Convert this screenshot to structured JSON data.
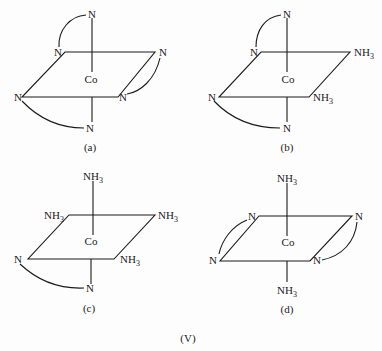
{
  "figure": {
    "label": "(V)",
    "central_atom": "Co",
    "panels": [
      {
        "id": "a",
        "caption": "(a)",
        "ligands": {
          "top": "N",
          "bottom": "N",
          "back_left": "N",
          "back_right": "N",
          "front_left": "N",
          "front_right": "N"
        },
        "chelate_arcs": [
          "top-back_left",
          "front_left-bottom",
          "back_right-front_right"
        ]
      },
      {
        "id": "b",
        "caption": "(b)",
        "ligands": {
          "top": "N",
          "bottom": "N",
          "back_left": "N",
          "back_right": "NH3",
          "front_left": "N",
          "front_right": "NH3"
        },
        "chelate_arcs": [
          "top-back_left",
          "front_left-bottom"
        ]
      },
      {
        "id": "c",
        "caption": "(c)",
        "ligands": {
          "top": "NH3",
          "bottom": "N",
          "back_left": "NH3",
          "back_right": "NH3",
          "front_left": "N",
          "front_right": "NH3"
        },
        "chelate_arcs": [
          "front_left-bottom"
        ]
      },
      {
        "id": "d",
        "caption": "(d)",
        "ligands": {
          "top": "NH3",
          "bottom": "NH3",
          "back_left": "N",
          "back_right": "N",
          "front_left": "N",
          "front_right": "N"
        },
        "chelate_arcs": [
          "back_left-front_left",
          "back_right-front_right"
        ]
      }
    ]
  }
}
